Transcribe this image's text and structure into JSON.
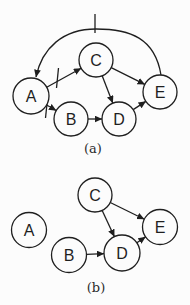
{
  "figure": {
    "background": "#fcfcfc",
    "ink": "#1f1f1f",
    "diagrams": [
      {
        "name": "a",
        "caption": "(a)",
        "caption_pos": {
          "x": 93,
          "y": 153
        },
        "nodes": [
          {
            "id": "A",
            "label": "A",
            "x": 31,
            "y": 96,
            "r": 18
          },
          {
            "id": "B",
            "label": "B",
            "x": 71,
            "y": 119,
            "r": 17
          },
          {
            "id": "C",
            "label": "C",
            "x": 96,
            "y": 60,
            "r": 17
          },
          {
            "id": "D",
            "label": "D",
            "x": 119,
            "y": 119,
            "r": 17
          },
          {
            "id": "E",
            "label": "E",
            "x": 160,
            "y": 92,
            "r": 17
          }
        ],
        "edges": [
          {
            "from": "E",
            "to": "A",
            "path": "M 161,75 C 155,38 130,29 96,29 C 63,29 42,48 36,77",
            "tick": {
              "x1": 95,
              "y1": 14,
              "x2": 95,
              "y2": 33
            }
          },
          {
            "from": "A",
            "to": "C",
            "tick": {
              "x1": 58.5,
              "y1": 68,
              "x2": 56.5,
              "y2": 88
            }
          },
          {
            "from": "A",
            "to": "B",
            "tick": {
              "x1": 47.5,
              "y1": 99,
              "x2": 45.5,
              "y2": 118
            }
          },
          {
            "from": "B",
            "to": "D"
          },
          {
            "from": "C",
            "to": "D"
          },
          {
            "from": "C",
            "to": "E"
          },
          {
            "from": "D",
            "to": "E"
          }
        ]
      },
      {
        "name": "b",
        "caption": "(b)",
        "caption_pos": {
          "x": 96,
          "y": 292
        },
        "nodes": [
          {
            "id": "A",
            "label": "A",
            "x": 29,
            "y": 230,
            "r": 17.5
          },
          {
            "id": "B",
            "label": "B",
            "x": 69,
            "y": 255,
            "r": 17.5
          },
          {
            "id": "C",
            "label": "C",
            "x": 95,
            "y": 195,
            "r": 17
          },
          {
            "id": "D",
            "label": "D",
            "x": 122,
            "y": 253,
            "r": 18
          },
          {
            "id": "E",
            "label": "E",
            "x": 160,
            "y": 227,
            "r": 17.5
          }
        ],
        "edges": [
          {
            "from": "C",
            "to": "D"
          },
          {
            "from": "C",
            "to": "E"
          },
          {
            "from": "B",
            "to": "D"
          },
          {
            "from": "D",
            "to": "E"
          }
        ]
      }
    ]
  }
}
